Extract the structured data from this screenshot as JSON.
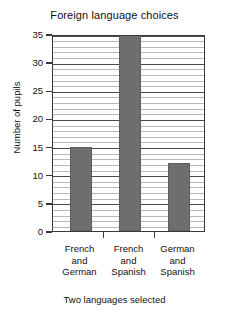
{
  "chart_data": {
    "type": "bar",
    "title": "Foreign language choices",
    "xlabel": "Two languages selected",
    "ylabel": "Number of pupils",
    "categories": [
      "French and German",
      "French and Spanish",
      "German and Spanish"
    ],
    "category_lines": [
      [
        "French",
        "and",
        "German"
      ],
      [
        "French",
        "and",
        "Spanish"
      ],
      [
        "German",
        "and",
        "Spanish"
      ]
    ],
    "values": [
      15,
      35,
      12
    ],
    "ylim": [
      0,
      35
    ],
    "ytick_labels": [
      "0",
      "5",
      "10",
      "15",
      "20",
      "25",
      "30",
      "35"
    ],
    "ytick_values": [
      0,
      5,
      10,
      15,
      20,
      25,
      30,
      35
    ],
    "ytick_minor_step": 1,
    "grid": "horizontal",
    "legend": "none",
    "bar_color": "#6e6e6e",
    "frame_color": "#3a3a3a",
    "grid_major_color": "#4a4a4a",
    "grid_minor_color": "#b9b9b9"
  }
}
